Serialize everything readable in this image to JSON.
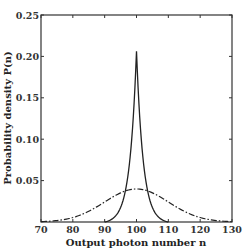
{
  "chart_data": {
    "type": "line",
    "title": "",
    "xlabel": "Output photon number n",
    "ylabel": "Probability density P(n)",
    "xlim": [
      70,
      130
    ],
    "ylim": [
      0,
      0.25
    ],
    "xticks": [
      70,
      80,
      90,
      100,
      110,
      120,
      130
    ],
    "xtick_labels": [
      "70",
      "80",
      "90",
      "100",
      "110",
      "120",
      "130"
    ],
    "yticks": [
      0.05,
      0.1,
      0.15,
      0.2,
      0.25
    ],
    "ytick_labels": [
      "0.05",
      "0.10",
      "0.15",
      "0.20",
      "0.25"
    ],
    "grid": false,
    "legend": null,
    "series": [
      {
        "name": "narrow (solid)",
        "style": "solid",
        "x": [
          90,
          92,
          94,
          96,
          97,
          98,
          99,
          99.5,
          100,
          100.5,
          101,
          102,
          103,
          104,
          106,
          108,
          110
        ],
        "values": [
          0.0,
          0.004,
          0.012,
          0.03,
          0.048,
          0.078,
          0.128,
          0.165,
          0.208,
          0.165,
          0.128,
          0.078,
          0.048,
          0.03,
          0.012,
          0.004,
          0.0
        ]
      },
      {
        "name": "broad (dash-dot)",
        "style": "dashdot",
        "x": [
          70,
          75,
          80,
          85,
          90,
          95,
          100,
          105,
          110,
          115,
          120,
          125,
          130
        ],
        "values": [
          0.0005,
          0.0018,
          0.0054,
          0.013,
          0.024,
          0.035,
          0.0399,
          0.035,
          0.024,
          0.013,
          0.0054,
          0.0018,
          0.0005
        ]
      }
    ]
  }
}
